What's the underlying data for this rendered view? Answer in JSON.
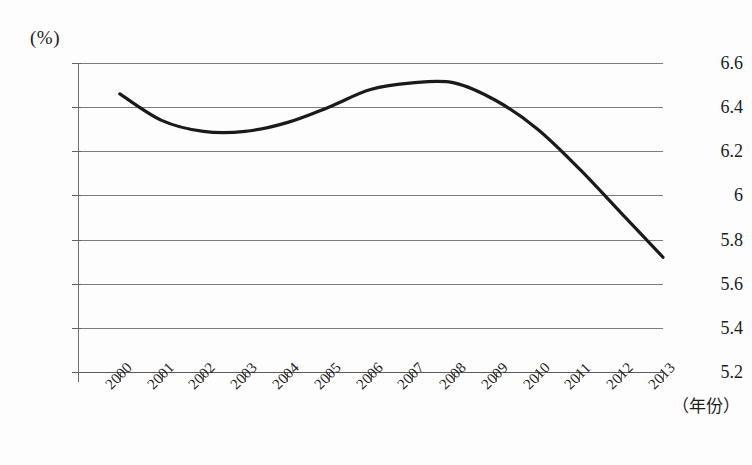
{
  "chart_data": {
    "type": "line",
    "title": "",
    "subtitle": "",
    "xlabel": "（年份）",
    "ylabel": "(%)",
    "unit_label": "(%)",
    "grid": true,
    "legend": "none",
    "x": [
      "2000",
      "2001",
      "2002",
      "2003",
      "2004",
      "2005",
      "2006",
      "2007",
      "2008",
      "2009",
      "2010",
      "2011",
      "2012",
      "2013"
    ],
    "categories": [
      "2000",
      "2001",
      "2002",
      "2003",
      "2004",
      "2005",
      "2006",
      "2007",
      "2008",
      "2009",
      "2010",
      "2011",
      "2012",
      "2013"
    ],
    "series": [
      {
        "name": "",
        "color": "#1a1a1a",
        "values": [
          6.46,
          6.34,
          6.29,
          6.29,
          6.33,
          6.4,
          6.48,
          6.51,
          6.51,
          6.43,
          6.3,
          6.12,
          5.92,
          5.72
        ]
      }
    ],
    "values": [
      6.46,
      6.34,
      6.29,
      6.29,
      6.33,
      6.4,
      6.48,
      6.51,
      6.51,
      6.43,
      6.3,
      6.12,
      5.92,
      5.72
    ],
    "ylim": [
      5.2,
      6.6
    ],
    "y_ticks": [
      "6.6",
      "6.4",
      "6.2",
      "6",
      "5.8",
      "5.6",
      "5.4",
      "5.2"
    ],
    "y_tick_values": [
      6.6,
      6.4,
      6.2,
      6.0,
      5.8,
      5.6,
      5.4,
      5.2
    ],
    "xlim_ticks": 15
  },
  "axis": {
    "unit": "(%)",
    "x_title": "（年份）"
  }
}
